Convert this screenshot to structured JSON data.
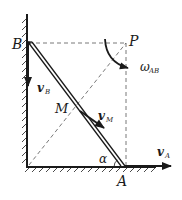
{
  "diagram": {
    "type": "mechanics-rod-sliding",
    "points": {
      "B": {
        "label": "B"
      },
      "P": {
        "label": "P"
      },
      "M": {
        "label": "M"
      },
      "A": {
        "label": "A"
      }
    },
    "angle": {
      "label": "α"
    },
    "vectors": {
      "v_B": {
        "main": "v",
        "sub": "B"
      },
      "v_M": {
        "main": "v",
        "sub": "M"
      },
      "v_A": {
        "main": "v",
        "sub": "A"
      }
    },
    "angular_velocity": {
      "main": "ω",
      "sub": "AB"
    },
    "colors": {
      "ink": "#1a1a1a",
      "dash": "#555555",
      "background": "#ffffff"
    }
  }
}
